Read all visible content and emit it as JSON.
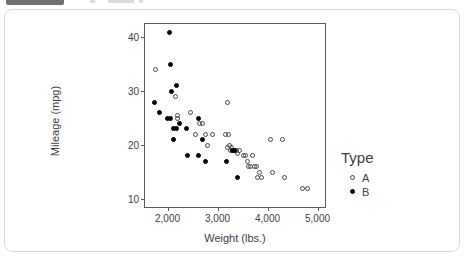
{
  "chart_data": {
    "type": "scatter",
    "title": "",
    "xlabel": "Weight (lbs.)",
    "ylabel": "Mileage (mpg)",
    "xlim": [
      1550,
      5150
    ],
    "ylim": [
      8.5,
      42.5
    ],
    "xticks": [
      2000,
      3000,
      4000,
      5000
    ],
    "xticklabels": [
      "2,000",
      "3,000",
      "4,000",
      "5,000"
    ],
    "yticks": [
      10,
      20,
      30,
      40
    ],
    "yticklabels": [
      "10",
      "20",
      "30",
      "40"
    ],
    "grid": false,
    "legend": {
      "title": "Type",
      "position": "right",
      "entries": [
        {
          "label": "A",
          "marker": "open-circle",
          "color": "#4a4a4a"
        },
        {
          "label": "B",
          "marker": "filled-circle",
          "color": "#000000"
        }
      ]
    },
    "series": [
      {
        "name": "A",
        "marker": "open-circle",
        "points": [
          [
            1760,
            34
          ],
          [
            2160,
            29
          ],
          [
            2200,
            25
          ],
          [
            2190,
            25.5
          ],
          [
            2460,
            26
          ],
          [
            2560,
            22
          ],
          [
            2640,
            24
          ],
          [
            2700,
            24
          ],
          [
            2760,
            22
          ],
          [
            2800,
            20
          ],
          [
            2900,
            22
          ],
          [
            3190,
            28
          ],
          [
            3160,
            22
          ],
          [
            3220,
            22
          ],
          [
            3200,
            19.5
          ],
          [
            3230,
            20
          ],
          [
            3250,
            19
          ],
          [
            3270,
            19.5
          ],
          [
            3300,
            19
          ],
          [
            3340,
            19
          ],
          [
            3380,
            19
          ],
          [
            3400,
            18.5
          ],
          [
            3430,
            19
          ],
          [
            3520,
            18
          ],
          [
            3560,
            18
          ],
          [
            3600,
            17
          ],
          [
            3620,
            16
          ],
          [
            3660,
            16
          ],
          [
            3700,
            18
          ],
          [
            3740,
            16
          ],
          [
            3780,
            16
          ],
          [
            3800,
            14
          ],
          [
            3840,
            15
          ],
          [
            3880,
            14
          ],
          [
            4050,
            21
          ],
          [
            4100,
            15
          ],
          [
            4300,
            21
          ],
          [
            4330,
            14
          ],
          [
            4700,
            12
          ],
          [
            4800,
            12
          ]
        ]
      },
      {
        "name": "B",
        "marker": "filled-circle",
        "points": [
          [
            2030,
            41
          ],
          [
            2060,
            35
          ],
          [
            2180,
            31
          ],
          [
            2080,
            30
          ],
          [
            1740,
            28
          ],
          [
            1840,
            26
          ],
          [
            1990,
            25
          ],
          [
            2050,
            25
          ],
          [
            2230,
            24
          ],
          [
            2120,
            23
          ],
          [
            2180,
            23
          ],
          [
            2370,
            23
          ],
          [
            2620,
            25
          ],
          [
            2700,
            21
          ],
          [
            2110,
            21
          ],
          [
            2400,
            18
          ],
          [
            2620,
            18
          ],
          [
            2760,
            17
          ],
          [
            3180,
            17
          ],
          [
            3290,
            19
          ],
          [
            3340,
            19
          ],
          [
            3400,
            14
          ]
        ]
      }
    ]
  }
}
